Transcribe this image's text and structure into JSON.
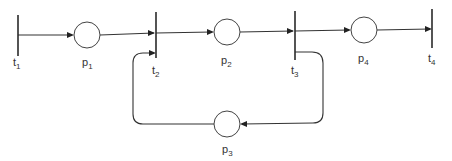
{
  "diagram": {
    "type": "petri-net",
    "colors": {
      "stroke": "#333333",
      "background": "#ffffff"
    },
    "transitions": [
      {
        "id": "t1",
        "label": "t",
        "sub": "1"
      },
      {
        "id": "t2",
        "label": "t",
        "sub": "2"
      },
      {
        "id": "t3",
        "label": "t",
        "sub": "3"
      },
      {
        "id": "t4",
        "label": "t",
        "sub": "4"
      }
    ],
    "places": [
      {
        "id": "p1",
        "label": "p",
        "sub": "1"
      },
      {
        "id": "p2",
        "label": "p",
        "sub": "2"
      },
      {
        "id": "p3",
        "label": "p",
        "sub": "3"
      },
      {
        "id": "p4",
        "label": "p",
        "sub": "4"
      }
    ],
    "arcs": [
      {
        "from": "t1",
        "to": "p1"
      },
      {
        "from": "p1",
        "to": "t2"
      },
      {
        "from": "t2",
        "to": "p2"
      },
      {
        "from": "p2",
        "to": "t3"
      },
      {
        "from": "t3",
        "to": "p4"
      },
      {
        "from": "p4",
        "to": "t4"
      },
      {
        "from": "t3",
        "to": "p3"
      },
      {
        "from": "p3",
        "to": "t2"
      }
    ]
  }
}
